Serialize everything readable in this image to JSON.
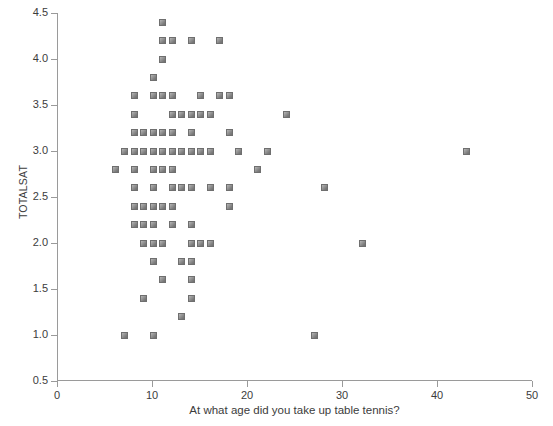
{
  "chart_data": {
    "type": "scatter",
    "title": "",
    "xlabel": "At what age did you take up table tennis?",
    "ylabel": "TOTALSAT",
    "xlim": [
      0,
      50
    ],
    "ylim": [
      0.5,
      4.5
    ],
    "xticks": [
      0,
      10,
      20,
      30,
      40,
      50
    ],
    "xtick_labels": [
      "0",
      "10",
      "20",
      "30",
      "40",
      "50"
    ],
    "yticks": [
      0.5,
      1.0,
      1.5,
      2.0,
      2.5,
      3.0,
      3.5,
      4.0,
      4.5
    ],
    "ytick_labels": [
      "0.5",
      "1.0",
      "1.5",
      "2.0",
      "2.5",
      "3.0",
      "3.5",
      "4.0",
      "4.5"
    ],
    "grid": false,
    "legend": null,
    "marker": {
      "shape": "square",
      "color": "#8a8a8a",
      "edge_color": "#6f6f6f",
      "size_px": 7
    },
    "series": [
      {
        "name": "respondents",
        "points": [
          [
            11,
            4.4
          ],
          [
            11,
            4.2
          ],
          [
            12,
            4.2
          ],
          [
            14,
            4.2
          ],
          [
            17,
            4.2
          ],
          [
            11,
            4.0
          ],
          [
            10,
            3.8
          ],
          [
            8,
            3.6
          ],
          [
            10,
            3.6
          ],
          [
            11,
            3.6
          ],
          [
            12,
            3.6
          ],
          [
            15,
            3.6
          ],
          [
            17,
            3.6
          ],
          [
            18,
            3.6
          ],
          [
            8,
            3.4
          ],
          [
            12,
            3.4
          ],
          [
            13,
            3.4
          ],
          [
            14,
            3.4
          ],
          [
            15,
            3.4
          ],
          [
            16,
            3.4
          ],
          [
            24,
            3.4
          ],
          [
            8,
            3.2
          ],
          [
            9,
            3.2
          ],
          [
            10,
            3.2
          ],
          [
            11,
            3.2
          ],
          [
            12,
            3.2
          ],
          [
            14,
            3.2
          ],
          [
            18,
            3.2
          ],
          [
            7,
            3.0
          ],
          [
            8,
            3.0
          ],
          [
            9,
            3.0
          ],
          [
            10,
            3.0
          ],
          [
            11,
            3.0
          ],
          [
            12,
            3.0
          ],
          [
            13,
            3.0
          ],
          [
            14,
            3.0
          ],
          [
            15,
            3.0
          ],
          [
            16,
            3.0
          ],
          [
            19,
            3.0
          ],
          [
            22,
            3.0
          ],
          [
            43,
            3.0
          ],
          [
            6,
            2.8
          ],
          [
            8,
            2.8
          ],
          [
            10,
            2.8
          ],
          [
            11,
            2.8
          ],
          [
            12,
            2.8
          ],
          [
            21,
            2.8
          ],
          [
            8,
            2.6
          ],
          [
            10,
            2.6
          ],
          [
            12,
            2.6
          ],
          [
            13,
            2.6
          ],
          [
            14,
            2.6
          ],
          [
            16,
            2.6
          ],
          [
            18,
            2.6
          ],
          [
            28,
            2.6
          ],
          [
            8,
            2.4
          ],
          [
            9,
            2.4
          ],
          [
            10,
            2.4
          ],
          [
            11,
            2.4
          ],
          [
            12,
            2.4
          ],
          [
            18,
            2.4
          ],
          [
            8,
            2.2
          ],
          [
            9,
            2.2
          ],
          [
            10,
            2.2
          ],
          [
            12,
            2.2
          ],
          [
            14,
            2.2
          ],
          [
            9,
            2.0
          ],
          [
            10,
            2.0
          ],
          [
            11,
            2.0
          ],
          [
            14,
            2.0
          ],
          [
            15,
            2.0
          ],
          [
            16,
            2.0
          ],
          [
            32,
            2.0
          ],
          [
            10,
            1.8
          ],
          [
            13,
            1.8
          ],
          [
            14,
            1.8
          ],
          [
            11,
            1.6
          ],
          [
            14,
            1.6
          ],
          [
            9,
            1.4
          ],
          [
            14,
            1.4
          ],
          [
            13,
            1.2
          ],
          [
            7,
            1.0
          ],
          [
            10,
            1.0
          ],
          [
            27,
            1.0
          ]
        ]
      }
    ]
  }
}
